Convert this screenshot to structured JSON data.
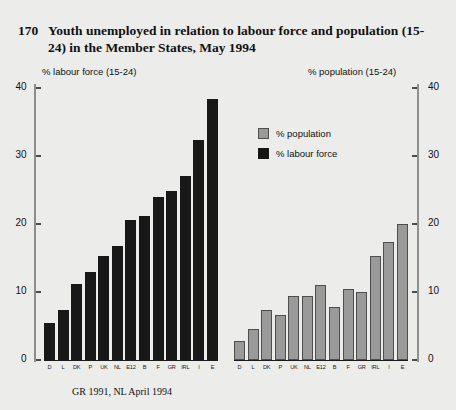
{
  "figure": {
    "number": "170",
    "title": "Youth unemployed in relation to labour force and population (15-24) in the Member States, May 1994",
    "footnote": "GR 1991, NL April 1994"
  },
  "left_caption": "% labour force (15-24)",
  "right_caption": "% population (15-24)",
  "legend": {
    "population_label": "% population",
    "labour_force_label": "% labour force"
  },
  "colors": {
    "labour_force": "#181818",
    "population": "#9a9a9a",
    "population_edge": "#4d4d4d",
    "background": "#ececeb",
    "axis": "#8e8e8e",
    "text": "#111111"
  },
  "axis_ticks": [
    "40",
    "30",
    "20",
    "10",
    "0"
  ],
  "chart_data": [
    {
      "type": "bar",
      "title": "% labour force (15-24)",
      "panel": "left",
      "xlabel": "",
      "ylabel": "% labour force (15-24)",
      "ylim": [
        0,
        40
      ],
      "yticks": [
        0,
        10,
        20,
        30,
        40
      ],
      "grid": false,
      "legend_position": "none",
      "series_name": "% labour force",
      "color": "#181818",
      "categories": [
        "D",
        "L",
        "DK",
        "P",
        "UK",
        "NL",
        "E12",
        "B",
        "F",
        "GR",
        "IRL",
        "I",
        "E"
      ],
      "values": [
        5.5,
        7.3,
        11.2,
        12.9,
        15.3,
        16.7,
        20.6,
        21.2,
        23.9,
        24.8,
        27.0,
        32.3,
        38.4
      ]
    },
    {
      "type": "bar",
      "title": "% population (15-24)",
      "panel": "right",
      "xlabel": "",
      "ylabel": "% population (15-24)",
      "ylim": [
        0,
        40
      ],
      "yticks": [
        0,
        10,
        20,
        30,
        40
      ],
      "grid": false,
      "legend_position": "upper-left",
      "series_name": "% population",
      "color": "#9a9a9a",
      "categories": [
        "D",
        "L",
        "DK",
        "P",
        "UK",
        "NL",
        "E12",
        "B",
        "F",
        "GR",
        "IRL",
        "I",
        "E"
      ],
      "values": [
        2.8,
        4.5,
        7.3,
        6.6,
        9.4,
        9.4,
        11.0,
        7.8,
        10.4,
        10.0,
        15.3,
        17.4,
        20.0
      ]
    }
  ]
}
